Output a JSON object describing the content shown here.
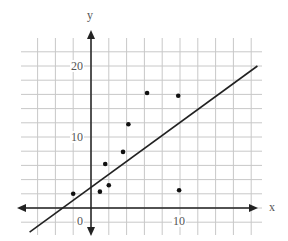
{
  "chart_data": {
    "type": "scatter",
    "title": "",
    "xlabel": "x",
    "ylabel": "y",
    "xlim": [
      -7,
      19
    ],
    "ylim": [
      -4,
      24
    ],
    "grid": true,
    "grid_step": {
      "x": 2,
      "y": 2
    },
    "tick_labels": {
      "x": [
        "10"
      ],
      "y": [
        "0",
        "10",
        "20"
      ]
    },
    "points": [
      {
        "x": -2,
        "y": 2
      },
      {
        "x": 1,
        "y": 2.3
      },
      {
        "x": 1.6,
        "y": 6.2
      },
      {
        "x": 2,
        "y": 3.2
      },
      {
        "x": 3.6,
        "y": 7.9
      },
      {
        "x": 4.2,
        "y": 11.8
      },
      {
        "x": 6.3,
        "y": 16.2
      },
      {
        "x": 9.8,
        "y": 15.8
      },
      {
        "x": 9.9,
        "y": 2.5
      }
    ],
    "line": {
      "x1": -6.9,
      "y1": -3.4,
      "x2": 18.7,
      "y2": 20
    },
    "colors": {
      "grid": "#c8c8c8",
      "axis": "#222222",
      "points": "#111111",
      "line": "#222222"
    }
  },
  "labels": {
    "x_axis": "x",
    "y_axis": "y",
    "origin": "0",
    "y10": "10",
    "y20": "20",
    "x10": "10"
  }
}
